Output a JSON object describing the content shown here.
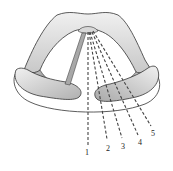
{
  "diagram": {
    "colors": {
      "outline": "#333333",
      "fill_light": "#e4e4e4",
      "fill_dark": "#8a8a8a",
      "dash": "#444444",
      "background": "#ffffff"
    },
    "rays": [
      {
        "label": "1"
      },
      {
        "label": "2"
      },
      {
        "label": "3"
      },
      {
        "label": "4"
      },
      {
        "label": "5"
      }
    ]
  }
}
